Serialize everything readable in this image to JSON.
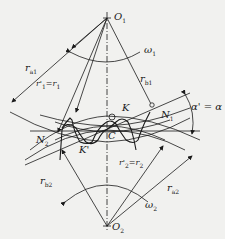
{
  "diagram": {
    "type": "involute gear meshing",
    "colors": {
      "line": "#1a1a1a",
      "background": "#f1f1ef"
    },
    "labels": {
      "o1": "O",
      "o1_sub": "1",
      "o2": "O",
      "o2_sub": "2",
      "omega1": "ω",
      "omega1_sub": "1",
      "omega2": "ω",
      "omega2_sub": "2",
      "ra1": "r",
      "ra1_sub": "a1",
      "rb1": "r",
      "rb1_sub": "b1",
      "r1": "r'",
      "r1_sub": "1",
      "r1_eq": "=r",
      "r1_eq_sub": "1",
      "ra2": "r",
      "ra2_sub": "a2",
      "rb2": "r",
      "rb2_sub": "b2",
      "r2": "r'",
      "r2_sub": "2",
      "r2_eq": "=r",
      "r2_eq_sub": "2",
      "k": "K",
      "k_prime": "K'",
      "c": "C",
      "n1": "N",
      "n1_sub": "1",
      "n2": "N",
      "n2_sub": "2",
      "alpha": "α' = α"
    }
  }
}
